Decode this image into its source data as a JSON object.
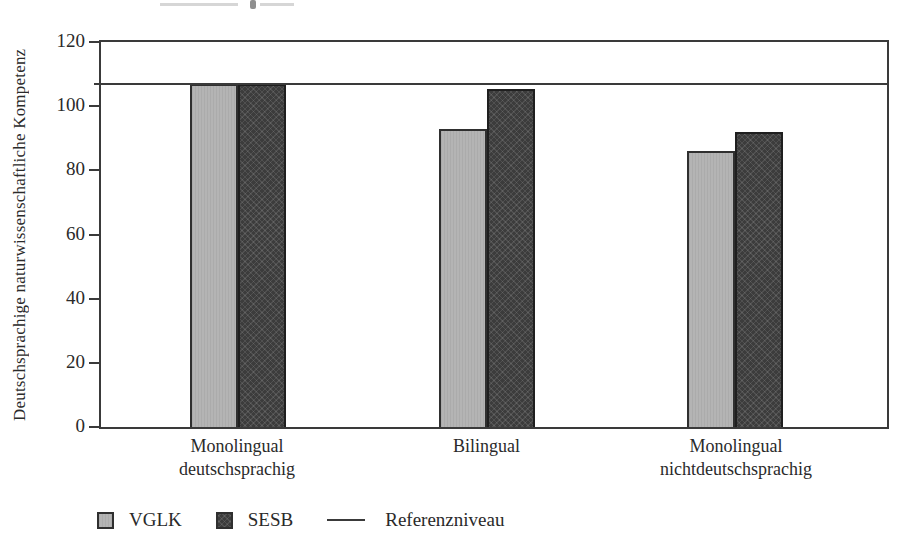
{
  "chart_data": {
    "type": "bar",
    "title": "",
    "xlabel": "",
    "ylabel": "Deutschsprachige naturwissenschaftliche Kompetenz",
    "ylim": [
      0,
      120
    ],
    "yticks": [
      0,
      20,
      40,
      60,
      80,
      100,
      120
    ],
    "grid": false,
    "legend_position": "bottom-left",
    "categories": [
      "Monolingual\ndeutschsprachig",
      "Bilingual",
      "Monolingual\nnichtdeutschsprachig"
    ],
    "series": [
      {
        "name": "VGLK",
        "color": "#b4b4b4",
        "values": [
          107,
          93,
          86
        ]
      },
      {
        "name": "SESB",
        "color": "#3c3c3c",
        "values": [
          107,
          105.5,
          92
        ]
      }
    ],
    "reference_line": {
      "label": "Referenzniveau",
      "value": 107,
      "color": "#3a3a3a"
    }
  }
}
